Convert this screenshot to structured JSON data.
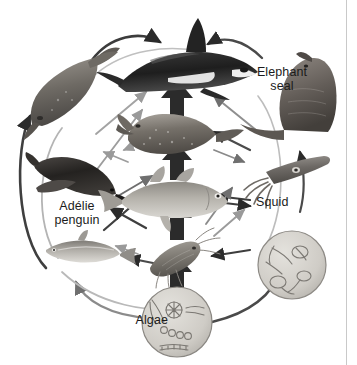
{
  "figure": {
    "type": "food-web-diagram",
    "background_color": "#ffffff",
    "ink_color": "#1b1b1b",
    "arrow_color_primary": "#2b2b2b",
    "arrow_color_secondary": "#8e8e8e"
  },
  "labels": {
    "elephant_seal": "Elephant\nseal",
    "adelie_penguin": "Adélie\npenguin",
    "squid": "Squid",
    "algae": "Algae"
  },
  "organisms": [
    {
      "id": "orca",
      "name": "killer-whale",
      "label": "",
      "position": "top-center"
    },
    {
      "id": "elephant-seal",
      "name": "elephant-seal",
      "label": "Elephant seal",
      "position": "right-upper"
    },
    {
      "id": "leopard-seal",
      "name": "leopard-seal",
      "label": "",
      "position": "left-upper"
    },
    {
      "id": "crabeater-seal",
      "name": "spotted-seal",
      "label": "",
      "position": "center-upper"
    },
    {
      "id": "adelie-penguin",
      "name": "adelie-penguin",
      "label": "Adélie penguin",
      "position": "left-middle"
    },
    {
      "id": "squid",
      "name": "squid",
      "label": "Squid",
      "position": "right-middle"
    },
    {
      "id": "cod",
      "name": "antarctic-cod",
      "label": "",
      "position": "center"
    },
    {
      "id": "silverfish",
      "name": "antarctic-silverfish",
      "label": "",
      "position": "left-lower"
    },
    {
      "id": "krill",
      "name": "krill",
      "label": "",
      "position": "center-lower"
    },
    {
      "id": "zooplankton",
      "name": "zooplankton-inset",
      "label": "",
      "position": "right-lower"
    },
    {
      "id": "algae",
      "name": "algae-inset",
      "label": "Algae",
      "position": "bottom-center"
    }
  ],
  "feeding_links": [
    {
      "from": "algae",
      "to": "krill"
    },
    {
      "from": "algae",
      "to": "zooplankton"
    },
    {
      "from": "algae",
      "to": "silverfish"
    },
    {
      "from": "krill",
      "to": "cod"
    },
    {
      "from": "krill",
      "to": "silverfish"
    },
    {
      "from": "krill",
      "to": "adelie-penguin"
    },
    {
      "from": "krill",
      "to": "squid"
    },
    {
      "from": "zooplankton",
      "to": "krill"
    },
    {
      "from": "silverfish",
      "to": "adelie-penguin"
    },
    {
      "from": "silverfish",
      "to": "cod"
    },
    {
      "from": "cod",
      "to": "crabeater-seal"
    },
    {
      "from": "cod",
      "to": "squid"
    },
    {
      "from": "cod",
      "to": "adelie-penguin"
    },
    {
      "from": "squid",
      "to": "elephant-seal"
    },
    {
      "from": "squid",
      "to": "cod"
    },
    {
      "from": "adelie-penguin",
      "to": "leopard-seal"
    },
    {
      "from": "crabeater-seal",
      "to": "orca"
    },
    {
      "from": "leopard-seal",
      "to": "orca"
    },
    {
      "from": "elephant-seal",
      "to": "orca"
    }
  ]
}
